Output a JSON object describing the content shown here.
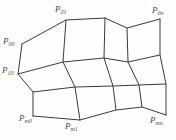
{
  "figure": {
    "background_color": "#fefefe",
    "line_color": "#3a3a3a",
    "label_color": "#4a4a4a",
    "grid_rows": 4,
    "grid_cols": 4
  },
  "labels": {
    "p00": {
      "base": "P",
      "sub": "00"
    },
    "p01": {
      "base": "P",
      "sub": "01"
    },
    "p0n": {
      "base": "P",
      "sub": "0n"
    },
    "p10": {
      "base": "P",
      "sub": "10"
    },
    "pm0": {
      "base": "P",
      "sub": "m0"
    },
    "pm1": {
      "base": "P",
      "sub": "m1"
    },
    "pmn": {
      "base": "P",
      "sub": "mn"
    }
  },
  "chart_data": {
    "type": "scatter",
    "xlabel": "",
    "ylabel": "",
    "grid": true,
    "legend": "none",
    "xlim": [
      0,
      176
    ],
    "ylim": [
      0,
      140
    ],
    "control_net": {
      "rows": 4,
      "cols": 4,
      "points": [
        [
          [
            22,
            44
          ],
          [
            66,
            20
          ],
          [
            105,
            18
          ],
          [
            127,
            28
          ],
          [
            160,
            19
          ]
        ],
        [
          [
            18,
            74
          ],
          [
            63,
            62
          ],
          [
            104,
            58
          ],
          [
            128,
            62
          ],
          [
            160,
            55
          ]
        ],
        [
          [
            33,
            92
          ],
          [
            75,
            87
          ],
          [
            113,
            86
          ],
          [
            139,
            85
          ],
          [
            166,
            84
          ]
        ],
        [
          [
            33,
            116
          ],
          [
            80,
            120
          ],
          [
            116,
            110
          ],
          [
            142,
            107
          ],
          [
            166,
            115
          ]
        ]
      ]
    },
    "labeled_corners": [
      {
        "label": "P00",
        "x": 14,
        "y": 42
      },
      {
        "label": "P10",
        "x": 12,
        "y": 72
      },
      {
        "label": "P01",
        "x": 62,
        "y": 12
      },
      {
        "label": "P0n",
        "x": 158,
        "y": 12
      },
      {
        "label": "Pm0",
        "x": 26,
        "y": 120
      },
      {
        "label": "Pm1",
        "x": 74,
        "y": 128
      },
      {
        "label": "Pmn",
        "x": 156,
        "y": 122
      }
    ]
  }
}
